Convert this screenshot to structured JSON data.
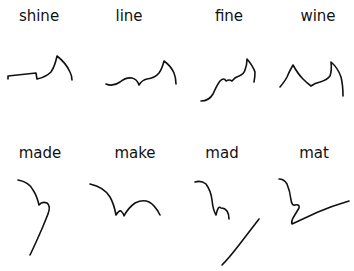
{
  "figure": {
    "ink_color": "#111111",
    "background": "#ffffff"
  },
  "rows": [
    {
      "items": [
        {
          "word": "shine",
          "label_x": 39,
          "label_y": 9
        },
        {
          "word": "line",
          "label_x": 129,
          "label_y": 9
        },
        {
          "word": "fine",
          "label_x": 229,
          "label_y": 9
        },
        {
          "word": "wine",
          "label_x": 318,
          "label_y": 9
        }
      ]
    },
    {
      "items": [
        {
          "word": "made",
          "label_x": 40,
          "label_y": 146
        },
        {
          "word": "make",
          "label_x": 135,
          "label_y": 146
        },
        {
          "word": "mad",
          "label_x": 222,
          "label_y": 146
        },
        {
          "word": "mat",
          "label_x": 314,
          "label_y": 146
        }
      ]
    }
  ]
}
